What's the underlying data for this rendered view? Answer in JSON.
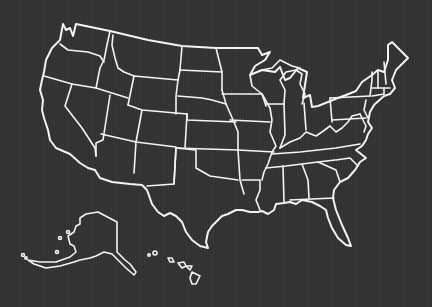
{
  "map": {
    "title": "United States map outline",
    "style": {
      "background": "#333333",
      "stroke": "#f4f4f4"
    },
    "regions": [
      "Contiguous United States",
      "Alaska",
      "Hawaii"
    ],
    "labels_visible": false
  }
}
